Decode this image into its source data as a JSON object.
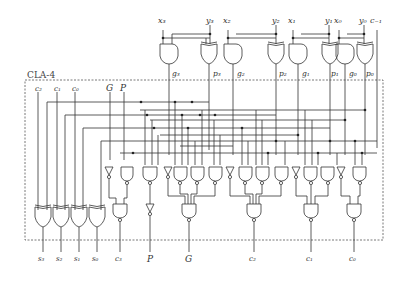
{
  "diagram": {
    "title": "CLA-4",
    "type": "4-bit carry-lookahead adder circuit",
    "top_inputs": [
      {
        "name": "x3",
        "label": "x₃",
        "x": 163
      },
      {
        "name": "y3",
        "label": "y₃",
        "x": 210
      },
      {
        "name": "x2",
        "label": "x₂",
        "x": 228
      },
      {
        "name": "y2",
        "label": "y₂",
        "x": 276
      },
      {
        "name": "x1",
        "label": "x₁",
        "x": 293
      },
      {
        "name": "y1",
        "label": "y₁",
        "x": 329
      },
      {
        "name": "x0",
        "label": "x₀",
        "x": 339
      },
      {
        "name": "y0",
        "label": "y₀",
        "x": 364
      },
      {
        "name": "cm1",
        "label": "c₋₁",
        "x": 377
      }
    ],
    "gp_outputs": [
      {
        "label": "g₃",
        "x": 172
      },
      {
        "label": "p₃",
        "x": 213
      },
      {
        "label": "g₂",
        "x": 237
      },
      {
        "label": "p₂",
        "x": 279
      },
      {
        "label": "g₁",
        "x": 302
      },
      {
        "label": "p₁",
        "x": 331
      },
      {
        "label": "g₀",
        "x": 349
      },
      {
        "label": "p₀",
        "x": 366
      }
    ],
    "box_inputs": [
      {
        "label": "c₂",
        "x": 38
      },
      {
        "label": "c₁",
        "x": 57
      },
      {
        "label": "c₀",
        "x": 75
      },
      {
        "label": "G",
        "x": 110
      },
      {
        "label": "P",
        "x": 124
      }
    ],
    "bottom_outputs": [
      {
        "label": "s₃",
        "x": 43
      },
      {
        "label": "s₂",
        "x": 61
      },
      {
        "label": "s₁",
        "x": 79
      },
      {
        "label": "s₀",
        "x": 97
      },
      {
        "label": "c₃",
        "x": 120
      },
      {
        "label": "P",
        "x": 151
      },
      {
        "label": "G",
        "x": 189
      },
      {
        "label": "c₂",
        "x": 254
      },
      {
        "label": "c₁",
        "x": 311
      },
      {
        "label": "c₀",
        "x": 354
      }
    ]
  }
}
